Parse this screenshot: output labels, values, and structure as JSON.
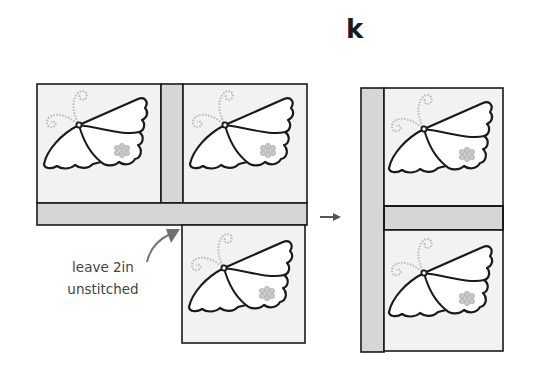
{
  "figure": {
    "step_label": "k",
    "annotation": {
      "line1": "leave 2in",
      "line2": "unstitched"
    },
    "colors": {
      "block_fill": "#f2f2f2",
      "sashing_fill": "#d6d6d6",
      "outline": "#1a1a1a",
      "antenna": "#b8b8b8",
      "flower": "#b4b4b4",
      "arrow": "#666666"
    },
    "before": {
      "blocks": [
        {
          "id": "block-a",
          "x": 37,
          "y": 84,
          "w": 124,
          "h": 119
        },
        {
          "id": "block-b",
          "x": 183,
          "y": 84,
          "w": 124,
          "h": 119
        },
        {
          "id": "block-c",
          "x": 182,
          "y": 225,
          "w": 123,
          "h": 118
        }
      ],
      "sashing": [
        {
          "id": "vertical-sash",
          "x": 161,
          "y": 84,
          "w": 22,
          "h": 119
        },
        {
          "id": "horizontal-sash",
          "x": 37,
          "y": 203,
          "w": 270,
          "h": 22
        }
      ]
    },
    "after": {
      "blocks": [
        {
          "id": "block-d",
          "x": 384,
          "y": 88,
          "w": 119,
          "h": 118
        },
        {
          "id": "block-e",
          "x": 384,
          "y": 230,
          "w": 119,
          "h": 121
        }
      ],
      "sashing": [
        {
          "id": "long-vertical-sash",
          "x": 361,
          "y": 88,
          "w": 23,
          "h": 264
        },
        {
          "id": "horizontal-sash",
          "x": 384,
          "y": 206,
          "w": 119,
          "h": 24
        }
      ]
    },
    "process_arrow": {
      "x1": 320,
      "y1": 217,
      "x2": 340,
      "y2": 217
    }
  }
}
